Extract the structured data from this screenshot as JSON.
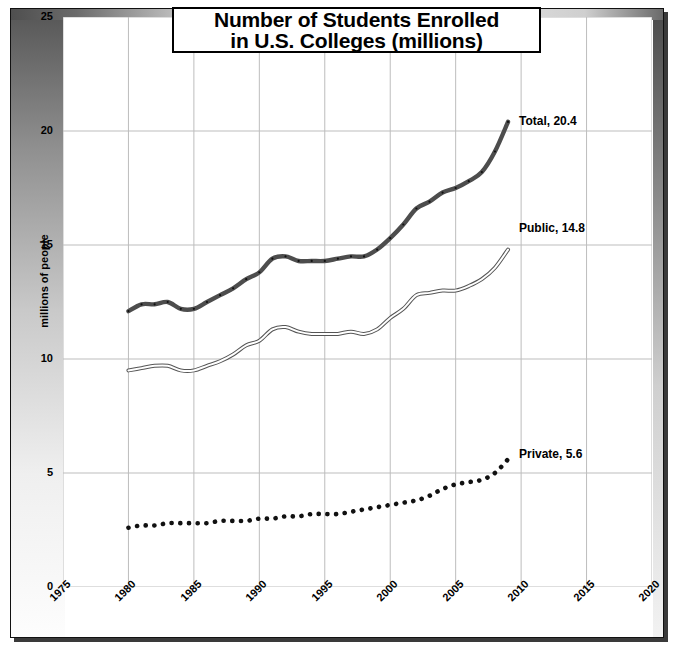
{
  "chart_data": {
    "type": "line",
    "title": "Number of Students Enrolled in U.S. Colleges (millions)",
    "title_line1": "Number of Students Enrolled",
    "title_line2": "in U.S. Colleges (millions)",
    "xlabel": "",
    "ylabel": "millions of people",
    "xlim": [
      1975,
      2020
    ],
    "ylim": [
      0,
      25
    ],
    "xticks": [
      "1975",
      "1980",
      "1985",
      "1990",
      "1995",
      "2000",
      "2005",
      "2010",
      "2015",
      "2020"
    ],
    "yticks": [
      "0",
      "5",
      "10",
      "15",
      "20",
      "25"
    ],
    "grid": true,
    "legend_position": "inline-right-of-line-end",
    "x": [
      1980,
      1981,
      1982,
      1983,
      1984,
      1985,
      1986,
      1987,
      1988,
      1989,
      1990,
      1991,
      1992,
      1993,
      1994,
      1995,
      1996,
      1997,
      1998,
      1999,
      2000,
      2001,
      2002,
      2003,
      2004,
      2005,
      2006,
      2007,
      2008,
      2009
    ],
    "series": [
      {
        "name": "Total",
        "end_label": "Total, 20.4",
        "end_value": 20.4,
        "style": "thick-solid",
        "color": "#4d4d4d",
        "values": [
          12.1,
          12.4,
          12.4,
          12.5,
          12.2,
          12.2,
          12.5,
          12.8,
          13.1,
          13.5,
          13.8,
          14.4,
          14.5,
          14.3,
          14.3,
          14.3,
          14.4,
          14.5,
          14.5,
          14.8,
          15.3,
          15.9,
          16.6,
          16.9,
          17.3,
          17.5,
          17.8,
          18.2,
          19.1,
          20.4
        ]
      },
      {
        "name": "Public",
        "end_label": "Public, 14.8",
        "end_value": 14.8,
        "style": "thin-outline",
        "color": "#555555",
        "values": [
          9.5,
          9.6,
          9.7,
          9.7,
          9.5,
          9.5,
          9.7,
          9.9,
          10.2,
          10.6,
          10.8,
          11.3,
          11.4,
          11.2,
          11.1,
          11.1,
          11.1,
          11.2,
          11.1,
          11.3,
          11.8,
          12.2,
          12.8,
          12.9,
          13.0,
          13.0,
          13.2,
          13.5,
          14.0,
          14.8
        ]
      },
      {
        "name": "Private",
        "end_label": "Private, 5.6",
        "end_value": 5.6,
        "style": "dotted",
        "color": "#111111",
        "values": [
          2.6,
          2.7,
          2.7,
          2.8,
          2.8,
          2.8,
          2.8,
          2.9,
          2.9,
          2.9,
          3.0,
          3.0,
          3.1,
          3.1,
          3.2,
          3.2,
          3.2,
          3.3,
          3.4,
          3.5,
          3.6,
          3.7,
          3.8,
          4.0,
          4.3,
          4.5,
          4.6,
          4.7,
          5.0,
          5.6
        ]
      }
    ]
  },
  "annotations": {
    "total": "Total, 20.4",
    "public": "Public, 14.8",
    "private": "Private, 5.6"
  }
}
